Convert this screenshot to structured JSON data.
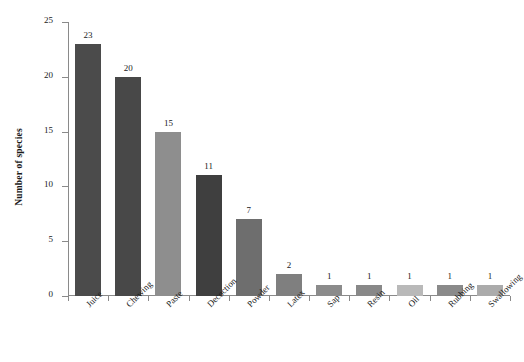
{
  "chart_data": {
    "type": "bar",
    "title": "",
    "xlabel": "",
    "ylabel": "Number of species",
    "ylim": [
      0,
      25
    ],
    "yticks": [
      0,
      5,
      10,
      15,
      20,
      25
    ],
    "ytick_labels": [
      "0",
      "5",
      "10",
      "15",
      "20",
      "25"
    ],
    "grid": false,
    "legend": false,
    "categories": [
      "Juice",
      "Chewing",
      "Paste",
      "Decoction",
      "Powder",
      "Latex",
      "Sap",
      "Resin",
      "Oil",
      "Rubbing",
      "Swallowing"
    ],
    "values": [
      23,
      20,
      15,
      11,
      7,
      2,
      1,
      1,
      1,
      1,
      1
    ],
    "value_labels": [
      "23",
      "20",
      "15",
      "11",
      "7",
      "2",
      "1",
      "1",
      "1",
      "1",
      "1"
    ],
    "bar_colors": [
      "#4b4b4b",
      "#484848",
      "#8e8e8e",
      "#3f3f3f",
      "#6e6e6e",
      "#7f7f7f",
      "#8b8b8b",
      "#888888",
      "#b9b9b9",
      "#8a8a8a",
      "#ababab"
    ],
    "axis_color": "#8a8a8a",
    "background_color": "#ffffff",
    "text_color": "#1a1a1a"
  }
}
